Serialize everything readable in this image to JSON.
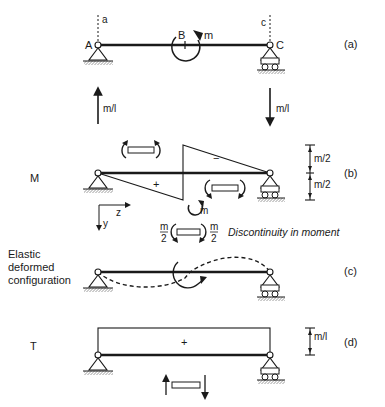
{
  "figure": {
    "panels": [
      {
        "id": "a",
        "tag": "(a)",
        "beam": {
          "left_support": "pin",
          "right_support": "roller"
        },
        "points": {
          "A": "A",
          "B": "B",
          "C": "C"
        },
        "section_marks": {
          "left": "a",
          "right": "c"
        },
        "applied_moment": "m",
        "reactions": {
          "left": "m/l",
          "right": "m/l"
        }
      },
      {
        "id": "b",
        "tag": "(b)",
        "quantity": "M",
        "signs": {
          "left": "+",
          "right": "−"
        },
        "dimensions": {
          "upper": "m/2",
          "lower": "m/2"
        },
        "axes": {
          "horizontal": "z",
          "vertical": "y"
        },
        "detail": {
          "moment": "m",
          "left_value_num": "m",
          "left_value_den": "2",
          "right_value_num": "m",
          "right_value_den": "2",
          "caption": "Discontinuity in moment"
        }
      },
      {
        "id": "c",
        "tag": "(c)",
        "caption_lines": [
          "Elastic",
          "deformed",
          "configuration"
        ]
      },
      {
        "id": "d",
        "tag": "(d)",
        "quantity": "T",
        "sign": "+",
        "dimension": "m/l"
      }
    ]
  }
}
